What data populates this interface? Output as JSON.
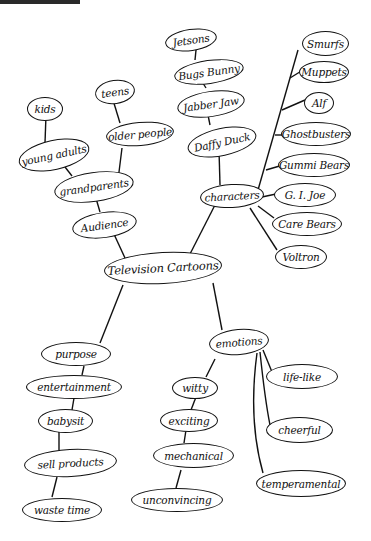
{
  "diagram": {
    "type": "mind-map",
    "central": "Television Cartoons",
    "branches": {
      "audience": {
        "label": "Audience",
        "items": [
          "grandparents",
          "young adults",
          "kids",
          "older people",
          "teens"
        ]
      },
      "characters": {
        "label": "characters",
        "chain": [
          "Daffy Duck",
          "Jabber Jaw",
          "Bugs Bunny",
          "Jetsons"
        ],
        "list": [
          "Smurfs",
          "Muppets",
          "Alf",
          "Ghostbusters",
          "Gummi Bears",
          "G. I. Joe",
          "Care Bears",
          "Voltron"
        ]
      },
      "purpose": {
        "label": "purpose",
        "items": [
          "entertainment",
          "babysit",
          "sell products",
          "waste time"
        ]
      },
      "emotions": {
        "label": "emotions",
        "chain": [
          "witty",
          "exciting",
          "mechanical",
          "unconvincing"
        ],
        "list": [
          "life-like",
          "cheerful",
          "temperamental"
        ]
      }
    }
  }
}
